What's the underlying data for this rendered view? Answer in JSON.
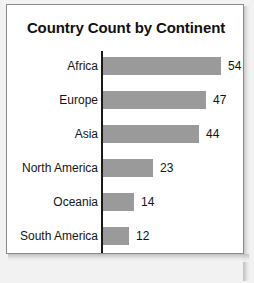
{
  "chart_data": {
    "type": "bar",
    "orientation": "horizontal",
    "title": "Country Count by Continent",
    "xlabel": "",
    "ylabel": "",
    "categories": [
      "Africa",
      "Europe",
      "Asia",
      "North America",
      "Oceania",
      "South America"
    ],
    "values": [
      54,
      47,
      44,
      23,
      14,
      12
    ],
    "value_labels": [
      "54",
      "47",
      "44",
      "23",
      "14",
      "12"
    ],
    "xlim": [
      0,
      54
    ],
    "grid": false,
    "legend": false,
    "bar_color": "#9a9a9a",
    "axis_color": "#1a1a1a",
    "background_color": "#ffffff",
    "border_color": "#8a8a8a",
    "max_value": 54,
    "bar_pixels_per_unit": 2.13
  }
}
